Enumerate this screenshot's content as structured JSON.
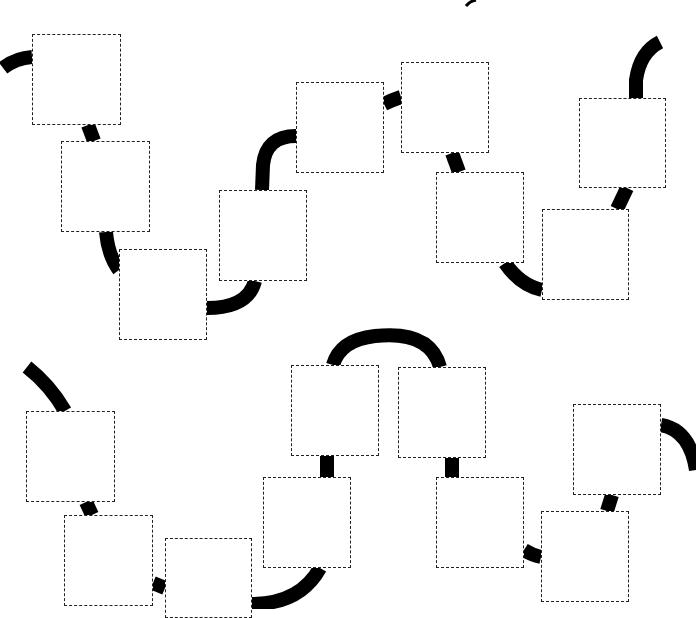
{
  "diagram": {
    "type": "path-puzzle",
    "colors": {
      "path": "#000000",
      "box_border": "#222222",
      "box_fill": "#ffffff",
      "background": "#ffffff"
    },
    "path_width": 14,
    "top_row": {
      "boxes": [
        {
          "id": "t1",
          "x": 32,
          "y": 34,
          "w": 89,
          "h": 91
        },
        {
          "id": "t2",
          "x": 61,
          "y": 141,
          "w": 89,
          "h": 91
        },
        {
          "id": "t3",
          "x": 119,
          "y": 249,
          "w": 88,
          "h": 91
        },
        {
          "id": "t4",
          "x": 219,
          "y": 190,
          "w": 88,
          "h": 91
        },
        {
          "id": "t5",
          "x": 296,
          "y": 82,
          "w": 88,
          "h": 91
        },
        {
          "id": "t6",
          "x": 401,
          "y": 62,
          "w": 88,
          "h": 91
        },
        {
          "id": "t7",
          "x": 436,
          "y": 172,
          "w": 88,
          "h": 91
        },
        {
          "id": "t8",
          "x": 542,
          "y": 209,
          "w": 87,
          "h": 91
        },
        {
          "id": "t9",
          "x": 579,
          "y": 98,
          "w": 87,
          "h": 90
        }
      ],
      "segments": [
        "M 3 68 Q 16 58 32 57",
        "M 88 125 L 94 141",
        "M 106 232 Q 108 255 119 270",
        "M 207 308 Q 248 308 255 281",
        "M 262 190 L 263 165 Q 266 136 296 136",
        "M 384 104 Q 392 100 401 97",
        "M 452 153 L 459 172",
        "M 505 263 Q 520 285 542 290",
        "M 617 209 L 627 188",
        "M 636 98 L 636 80 Q 640 52 660 42"
      ]
    },
    "bottom_row": {
      "boxes": [
        {
          "id": "b1",
          "x": 26,
          "y": 411,
          "w": 89,
          "h": 91
        },
        {
          "id": "b2",
          "x": 64,
          "y": 515,
          "w": 89,
          "h": 91
        },
        {
          "id": "b3",
          "x": 165,
          "y": 538,
          "w": 87,
          "h": 80
        },
        {
          "id": "b4",
          "x": 263,
          "y": 477,
          "w": 88,
          "h": 91
        },
        {
          "id": "b5",
          "x": 291,
          "y": 365,
          "w": 88,
          "h": 91
        },
        {
          "id": "b6",
          "x": 398,
          "y": 367,
          "w": 88,
          "h": 91
        },
        {
          "id": "b7",
          "x": 436,
          "y": 477,
          "w": 88,
          "h": 91
        },
        {
          "id": "b8",
          "x": 541,
          "y": 511,
          "w": 88,
          "h": 91
        },
        {
          "id": "b9",
          "x": 573,
          "y": 404,
          "w": 88,
          "h": 91
        }
      ],
      "segments": [
        "M 27 367 Q 50 385 65 411",
        "M 86 502 L 92 515",
        "M 153 583 L 165 588",
        "M 252 604 Q 300 604 320 568",
        "M 327 456 L 327 477",
        "M 333 365 Q 340 340 375 336 Q 430 330 440 367",
        "M 452 458 L 452 477",
        "M 524 550 Q 532 555 541 557",
        "M 612 495 L 607 511",
        "M 661 425 Q 690 430 696 470"
      ]
    },
    "stray_marks": [
      {
        "x": 470,
        "y": 2,
        "note": "small dark fragment at top edge"
      }
    ]
  }
}
